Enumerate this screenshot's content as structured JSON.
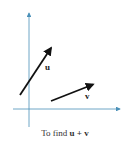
{
  "diagram": {
    "caption_prefix": "To find ",
    "caption_math": "u + v",
    "axis_color": "#4a90b8",
    "vector_color": "#111111",
    "vectors": [
      {
        "name": "u",
        "label": "u",
        "from": [
          20,
          95
        ],
        "to": [
          52,
          47
        ]
      },
      {
        "name": "v",
        "label": "v",
        "from": [
          51,
          101
        ],
        "to": [
          94,
          84
        ]
      }
    ],
    "axes": {
      "x": {
        "from": [
          13,
          109
        ],
        "to": [
          120,
          109
        ]
      },
      "y": {
        "from": [
          29,
          127
        ],
        "to": [
          29,
          12
        ]
      }
    }
  }
}
